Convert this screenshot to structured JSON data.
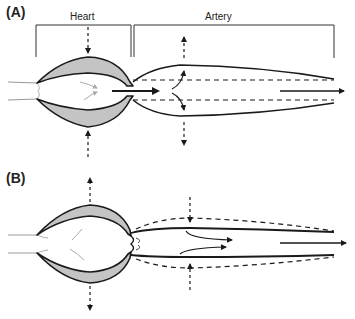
{
  "figure": {
    "panels": [
      {
        "id": "A",
        "label": "(A)"
      },
      {
        "id": "B",
        "label": "(B)"
      }
    ],
    "regions": {
      "heart": "Heart",
      "artery": "Artery"
    },
    "colors": {
      "stroke": "#1a1a1a",
      "wall_fill": "#c4c4c4",
      "thin_line": "#999999",
      "flow_arrow_light": "#aaaaaa"
    }
  }
}
